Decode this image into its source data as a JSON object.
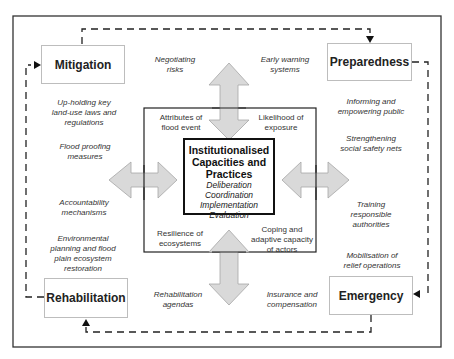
{
  "diagram": {
    "center": {
      "title_lines": [
        "Institutionalised",
        "Capacities and",
        "Practices"
      ],
      "items": [
        "Deliberation",
        "Coordination",
        "Implementation",
        "Evaluation"
      ]
    },
    "inner_attributes": {
      "top_left": [
        "Attributes of",
        "flood event"
      ],
      "top_right": [
        "Likelihood of",
        "exposure"
      ],
      "bottom_left": [
        "Resilience of",
        "ecosystems"
      ],
      "bottom_right": [
        "Coping and",
        "adaptive capacity",
        "of actors"
      ]
    },
    "phases": {
      "mitigation": "Mitigation",
      "preparedness": "Preparedness",
      "emergency": "Emergency",
      "rehabilitation": "Rehabilitation"
    },
    "notes": {
      "negotiating_risks": [
        "Negotiating",
        "risks"
      ],
      "early_warning": [
        "Early warning",
        "systems"
      ],
      "upholding_laws": [
        "Up-holding key",
        "land-use laws and",
        "regulations"
      ],
      "flood_proofing": [
        "Flood proofing",
        "measures"
      ],
      "accountability": [
        "Accountability",
        "mechanisms"
      ],
      "environmental_planning": [
        "Environmental",
        "planning and flood",
        "plain ecosystem",
        "restoration"
      ],
      "informing_public": [
        "Informing and",
        "empowering public"
      ],
      "safety_nets": [
        "Strengthening",
        "social safety nets"
      ],
      "training": [
        "Training",
        "responsible",
        "authorities"
      ],
      "mobilisation": [
        "Mobilisation of",
        "relief operations"
      ],
      "rehabilitation_agendas": [
        "Rehabilitation",
        "agendas"
      ],
      "insurance": [
        "Insurance and",
        "compensation"
      ]
    },
    "colors": {
      "arrow_fill": "#d9d9d9",
      "arrow_stroke": "#a6a6a6",
      "border": "#333333",
      "dashed": "#222222"
    }
  }
}
